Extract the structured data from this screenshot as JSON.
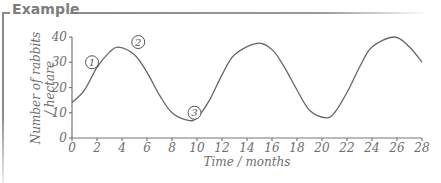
{
  "header": {
    "title": "Example"
  },
  "chart_data": {
    "type": "line",
    "title": "Example",
    "xlabel": "Time / months",
    "ylabel_line1": "Number of rabbits",
    "ylabel_line2": "/ hectare",
    "xlim": [
      0,
      28
    ],
    "ylim": [
      0,
      40
    ],
    "x_ticks": [
      0,
      2,
      4,
      6,
      8,
      10,
      12,
      14,
      16,
      18,
      20,
      22,
      24,
      26,
      28
    ],
    "y_ticks": [
      0,
      10,
      20,
      30,
      40
    ],
    "grid": false,
    "legend": null,
    "series": [
      {
        "name": "Rabbit population",
        "x": [
          0,
          1,
          2,
          3,
          3.7,
          5,
          6,
          7,
          8,
          9.3,
          10,
          11,
          12,
          13,
          14.8,
          16,
          17,
          18,
          19,
          20.3,
          21,
          22,
          23,
          24,
          25.8,
          27,
          28
        ],
        "y": [
          14,
          19,
          28,
          34,
          36,
          33,
          26,
          17,
          10,
          7,
          8,
          15,
          25,
          33,
          37.5,
          35,
          28,
          19,
          11,
          8,
          10,
          18,
          28,
          36,
          40,
          36,
          30
        ],
        "color": "#666666"
      }
    ],
    "annotations": [
      {
        "label": "1",
        "x": 1.6,
        "y": 30
      },
      {
        "label": "2",
        "x": 5.3,
        "y": 38
      },
      {
        "label": "3",
        "x": 9.8,
        "y": 10
      }
    ]
  }
}
